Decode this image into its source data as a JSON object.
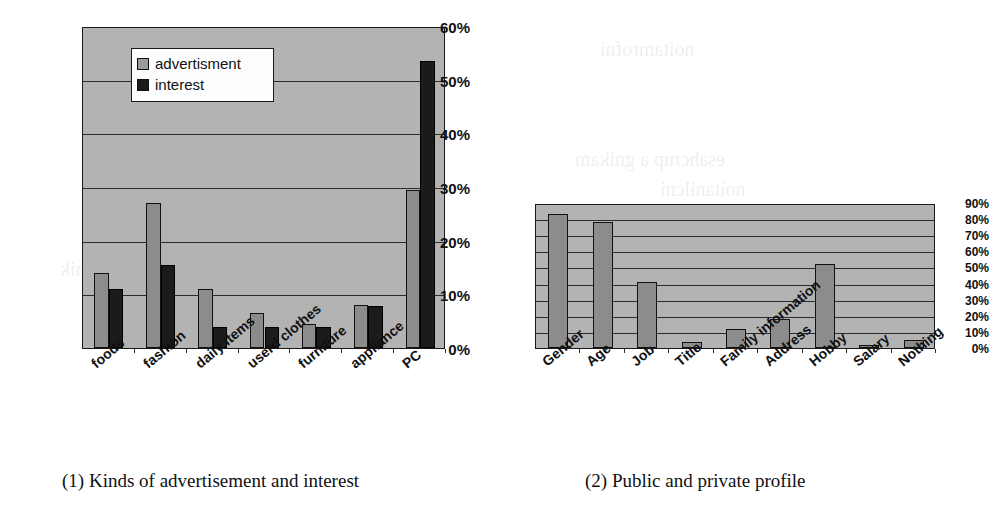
{
  "figure": {
    "panel1": {
      "caption": "(1) Kinds of advertisement and interest",
      "legend": {
        "series1_label": "advertisment",
        "series2_label": "interest"
      }
    },
    "panel2": {
      "caption": "(2) Public and private profile"
    }
  },
  "colors": {
    "plot_background": "#b3b3b3",
    "series_advertisment": "#8c8c8c",
    "series_interest": "#1b1b1b",
    "axis": "#1a1a1a",
    "gridline": "#2b2b2b"
  },
  "chart_data": [
    {
      "type": "bar",
      "title": "(1) Kinds of advertisement and interest",
      "xlabel": "",
      "ylabel": "",
      "ylim": [
        0,
        60
      ],
      "ytick_labels": [
        "0%",
        "10%",
        "20%",
        "30%",
        "40%",
        "50%",
        "60%"
      ],
      "ytick_values": [
        0,
        10,
        20,
        30,
        40,
        50,
        60
      ],
      "grid": true,
      "legend_position": "upper-left-inside",
      "categories": [
        "foods",
        "fashion",
        "daily items",
        "userd clothes",
        "furniture",
        "appliance",
        "PC"
      ],
      "series": [
        {
          "name": "advertisment",
          "color": "#8c8c8c",
          "values": [
            14.0,
            27.0,
            11.0,
            6.5,
            4.5,
            8.0,
            29.5
          ]
        },
        {
          "name": "interest",
          "color": "#1b1b1b",
          "values": [
            11.0,
            15.5,
            4.0,
            4.0,
            4.0,
            7.8,
            53.5
          ]
        }
      ]
    },
    {
      "type": "bar",
      "title": "(2) Public and private profile",
      "xlabel": "",
      "ylabel": "",
      "ylim": [
        0,
        90
      ],
      "ytick_labels": [
        "0%",
        "10%",
        "20%",
        "30%",
        "40%",
        "50%",
        "60%",
        "70%",
        "80%",
        "90%"
      ],
      "ytick_values": [
        0,
        10,
        20,
        30,
        40,
        50,
        60,
        70,
        80,
        90
      ],
      "grid": true,
      "legend_position": "none",
      "categories": [
        "Gender",
        "Age",
        "Job",
        "Title",
        "Family information",
        "Address",
        "Hobby",
        "Salary",
        "Nothing"
      ],
      "series": [
        {
          "name": "share",
          "color": "#8c8c8c",
          "values": [
            83,
            78,
            41,
            4,
            12,
            18,
            52,
            2,
            5
          ]
        }
      ]
    }
  ]
}
